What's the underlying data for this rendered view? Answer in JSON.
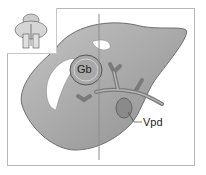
{
  "figure": {
    "labels": {
      "gallbladder": "Gb",
      "vessel": "Vpd"
    },
    "inset": {
      "icon": "orientation-thumbnail-icon"
    },
    "colors": {
      "organ_fill": "#9a9a9a",
      "organ_light": "#bdbdbd",
      "outline": "#6f6f6f",
      "frame": "#b8b8b8",
      "scan_line": "#8c8c8c"
    }
  }
}
